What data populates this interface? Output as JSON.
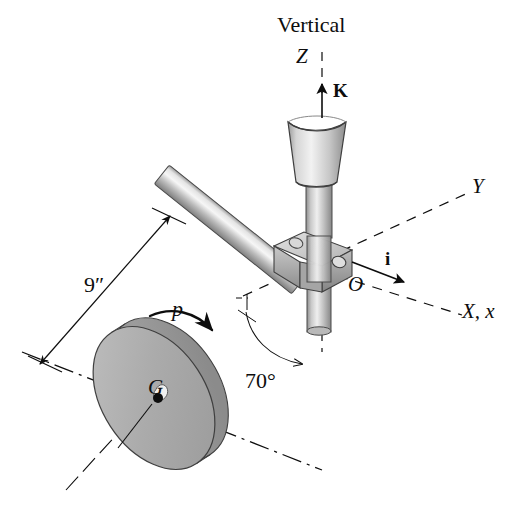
{
  "figure": {
    "title_text": "Vertical",
    "background_color": "#ffffff",
    "ink_color": "#0d0d0d",
    "metal_light": "#e8e8e8",
    "metal_mid": "#b5b5b5",
    "metal_dark": "#8a8a8a",
    "disk_face": "#a8a8a8",
    "disk_rim": "#8f8f8f"
  },
  "labels": {
    "vertical": "Vertical",
    "axis_z": "Z",
    "unit_vector_k": "K",
    "axis_y": "Y",
    "unit_vector_i": "i",
    "axis_x": "X, x",
    "point_o": "O",
    "point_g": "G",
    "dimension_9in": "9″",
    "spin_p": "p",
    "angle_70": "70°"
  },
  "geometry": {
    "disk_center": {
      "x": 154,
      "y": 398
    },
    "origin_o": {
      "x": 316,
      "y": 272
    },
    "shaft_length_label": "9″",
    "shaft_angle_from_vertical_deg": 70,
    "spin_direction": "p"
  }
}
